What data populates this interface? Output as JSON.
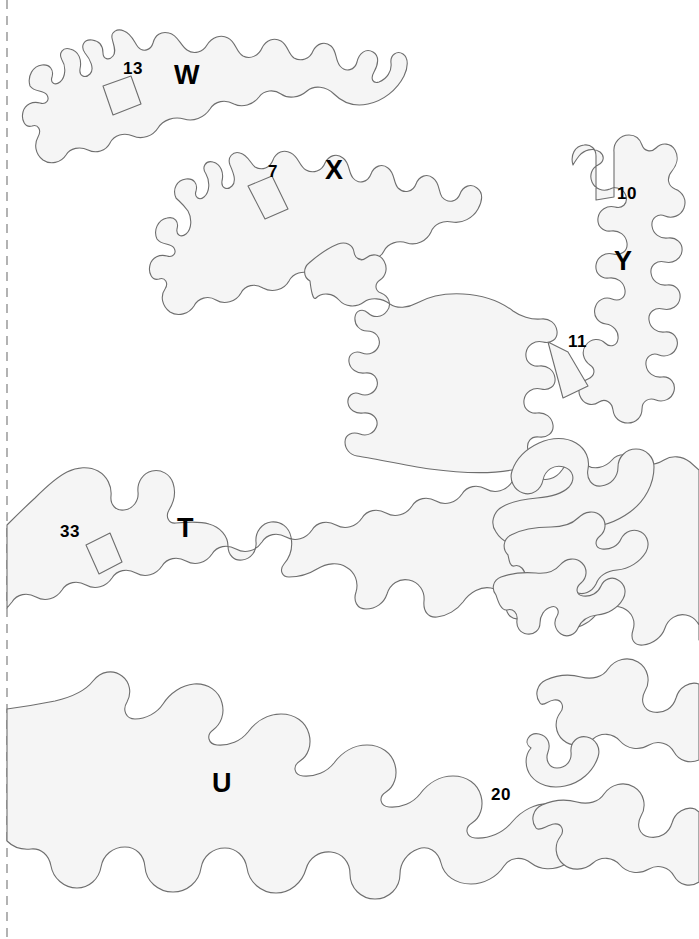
{
  "page": {
    "width": 699,
    "height": 939,
    "background_color": "#ffffff"
  },
  "fold_line": {
    "name": "dashed-fold-line",
    "orientation": "vertical",
    "x": 7,
    "color": "#a0a0a0",
    "style": "dashed"
  },
  "style": {
    "piece_fill": "#f5f5f5",
    "piece_stroke": "#6e6e6e",
    "label_color": "#000000"
  },
  "pieces": [
    {
      "id": "w",
      "letter": "W",
      "number": "13",
      "letter_pos": {
        "x": 174,
        "y": 62
      },
      "number_pos": {
        "x": 123,
        "y": 60
      }
    },
    {
      "id": "x",
      "letter": "X",
      "number": "7",
      "letter_pos": {
        "x": 325,
        "y": 157
      },
      "number_pos": {
        "x": 268,
        "y": 163
      }
    },
    {
      "id": "y",
      "letter": "Y",
      "number": "10",
      "number2": "11",
      "letter_pos": {
        "x": 614,
        "y": 248
      },
      "number_pos": {
        "x": 617,
        "y": 185
      },
      "number2_pos": {
        "x": 568,
        "y": 333
      }
    },
    {
      "id": "t",
      "letter": "T",
      "number": "33",
      "letter_pos": {
        "x": 177,
        "y": 515
      },
      "number_pos": {
        "x": 60,
        "y": 523
      }
    },
    {
      "id": "u",
      "letter": "U",
      "number": "20",
      "letter_pos": {
        "x": 212,
        "y": 770
      },
      "number_pos": {
        "x": 491,
        "y": 786
      }
    }
  ]
}
